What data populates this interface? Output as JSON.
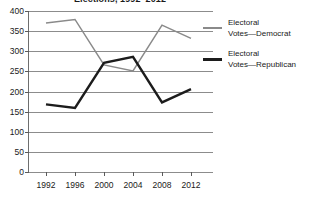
{
  "chart_data": {
    "type": "line",
    "title": "Elections, 1992–2012",
    "xlabel": "",
    "ylabel": "",
    "categories": [
      "1992",
      "1996",
      "2000",
      "2004",
      "2008",
      "2012"
    ],
    "series": [
      {
        "name": "Electoral Votes—Democrat",
        "color": "#8a8a8a",
        "values": [
          370,
          379,
          266,
          251,
          365,
          332
        ]
      },
      {
        "name": "Electoral Votes—Republican",
        "color": "#1c1c1c",
        "values": [
          168,
          159,
          271,
          286,
          173,
          206
        ]
      }
    ],
    "ylim": [
      0,
      400
    ],
    "ytick_labels": [
      "400",
      "350",
      "300",
      "250",
      "200",
      "150",
      "100",
      "50",
      "0"
    ],
    "ytick_values": [
      400,
      350,
      300,
      250,
      200,
      150,
      100,
      50,
      0
    ],
    "grid": true,
    "legend_position": "right"
  },
  "legend": {
    "entries": [
      {
        "line1": "Electoral",
        "line2": "Votes—Democrat"
      },
      {
        "line1": "Electoral",
        "line2": "Votes—Republican"
      }
    ]
  },
  "icons": {
    "democrat_line_swatch": "line-swatch-icon",
    "republican_line_swatch": "line-swatch-icon"
  }
}
